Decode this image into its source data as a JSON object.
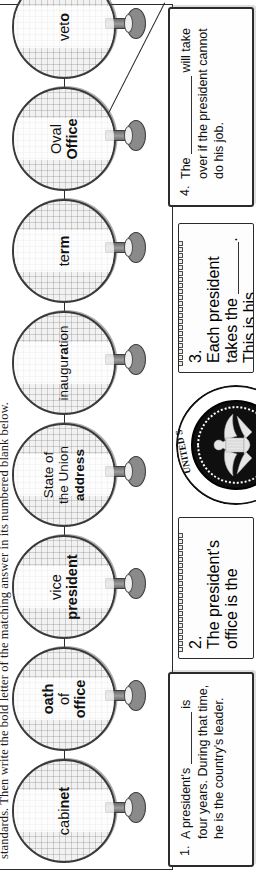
{
  "worksheet": {
    "instructions": "standards. Then write the bold letter of the matching answer in its numbered blank below.",
    "seal": {
      "name": "presidential-seal",
      "ring_text_top": "UNITED S",
      "ring_text_left": "OF THE",
      "ring_text_bottom": "THE PRESIDENT",
      "full_text": "SEAL OF THE PRESIDENT OF THE UNITED STATES"
    },
    "nodes": [
      {
        "id": "cabinet",
        "plain": "cabi",
        "bold": "net",
        "lines": [
          "cabinet"
        ]
      },
      {
        "id": "oath-of-office",
        "lines": [
          "oath",
          "of",
          "office"
        ],
        "bold_lines": [
          true,
          false,
          true
        ]
      },
      {
        "id": "vice-president",
        "lines": [
          "vice",
          "president"
        ],
        "bold_lines": [
          false,
          true
        ]
      },
      {
        "id": "state-of-the-union-address",
        "lines": [
          "State of",
          "the Union",
          "address"
        ],
        "bold_lines": [
          false,
          false,
          true
        ]
      },
      {
        "id": "inauguration",
        "plain_pre": "inaugu",
        "bold": "ra",
        "plain_post": "tion",
        "lines": [
          "inauguration"
        ]
      },
      {
        "id": "term",
        "plain_pre": "te",
        "bold": "rm",
        "plain_post": "",
        "lines": [
          "term"
        ]
      },
      {
        "id": "oval-office",
        "lines": [
          "Oval",
          "Office"
        ],
        "bold_lines": [
          false,
          true
        ]
      },
      {
        "id": "veto",
        "plain_pre": "vet",
        "bold": "o",
        "plain_post": "",
        "lines": [
          "veto"
        ]
      }
    ],
    "questions": [
      {
        "number": "1.",
        "kind": "paper-card",
        "segments": [
          "A president's ",
          "__BLANK__",
          " is four years. During that time, he is the country's leader."
        ]
      },
      {
        "number": "2.",
        "kind": "notepad",
        "segments": [
          "The president's office is the ",
          "__BLANK__",
          " ",
          "__BLANK__",
          "."
        ]
      },
      {
        "number": "3.",
        "kind": "notepad",
        "segments": [
          "Each president takes the ",
          "__BLANK__",
          ". This is his promise to be honest, be loyal, and do his best."
        ]
      },
      {
        "number": "4.",
        "kind": "paper-card",
        "segments": [
          "The ",
          "__BLANK__",
          " will take over if the president cannot do his job."
        ]
      }
    ]
  }
}
